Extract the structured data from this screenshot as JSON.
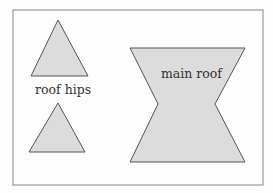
{
  "diagram": {
    "frame_color": "#888888",
    "shape_fill": "#dcdcdc",
    "shape_stroke": "#555555",
    "labels": {
      "hips": "roof hips",
      "main": "main roof"
    },
    "shapes": [
      {
        "name": "roof-hip-top",
        "type": "triangle"
      },
      {
        "name": "roof-hip-bottom",
        "type": "triangle"
      },
      {
        "name": "main-roof",
        "type": "hourglass"
      }
    ]
  }
}
